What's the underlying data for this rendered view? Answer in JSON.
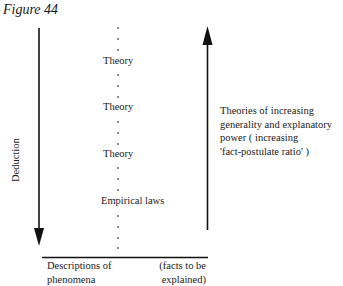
{
  "figure": {
    "title": "Figure 44",
    "deduction_label": "Deduction",
    "levels": [
      {
        "label": "Theory"
      },
      {
        "label": "Theory"
      },
      {
        "label": "Theory"
      },
      {
        "label": "Empirical laws"
      }
    ],
    "right_annotation": {
      "lines": [
        "Theories of increasing",
        "generality and explanatory",
        "power ( increasing",
        "'fact-postulate ratio' )"
      ]
    },
    "baseline": {
      "left_lines": [
        "Descriptions of",
        "phenomena"
      ],
      "right_lines": [
        "(facts to be",
        "explained)"
      ]
    },
    "arrows": {
      "left": "down",
      "right": "up"
    }
  }
}
